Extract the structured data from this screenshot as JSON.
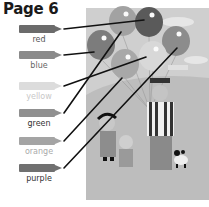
{
  "page": {
    "title": "Page 6"
  },
  "crayons": [
    {
      "label": "red",
      "body_color": "#6b6b6b",
      "label_color": "#555555",
      "y": 25
    },
    {
      "label": "blue",
      "body_color": "#8a8a8a",
      "label_color": "#666666",
      "y": 51
    },
    {
      "label": "yellow",
      "body_color": "#dcdcdc",
      "label_color": "#c8c8c8",
      "y": 82
    },
    {
      "label": "green",
      "body_color": "#909090",
      "label_color": "#333333",
      "y": 109
    },
    {
      "label": "orange",
      "body_color": "#a4a4a4",
      "label_color": "#aaaaaa",
      "y": 137
    },
    {
      "label": "purple",
      "body_color": "#707070",
      "label_color": "#333333",
      "y": 164
    }
  ],
  "balloons": [
    {
      "name": "top-left-balloon",
      "cx": 123,
      "cy": 21,
      "fill": "#a2a2a2"
    },
    {
      "name": "dark-balloon",
      "cx": 149,
      "cy": 22,
      "fill": "#5a5a5a"
    },
    {
      "name": "left-balloon",
      "cx": 101,
      "cy": 45,
      "fill": "#7c7c7c"
    },
    {
      "name": "right-balloon",
      "cx": 176,
      "cy": 41,
      "fill": "#8c8c8c"
    },
    {
      "name": "light-balloon",
      "cx": 153,
      "cy": 56,
      "fill": "#d8d8d8"
    },
    {
      "name": "lower-balloon",
      "cx": 125,
      "cy": 64,
      "fill": "#a8a8a8"
    }
  ],
  "match_lines": [
    {
      "from": "red",
      "x1": 64,
      "y1": 29,
      "x2": 144,
      "y2": 20
    },
    {
      "from": "blue",
      "x1": 64,
      "y1": 55,
      "x2": 94,
      "y2": 52
    },
    {
      "from": "yellow",
      "x1": 64,
      "y1": 86,
      "x2": 146,
      "y2": 57
    },
    {
      "from": "green",
      "x1": 64,
      "y1": 113,
      "x2": 121,
      "y2": 32
    },
    {
      "from": "orange",
      "x1": 64,
      "y1": 141,
      "x2": 122,
      "y2": 78
    },
    {
      "from": "purple",
      "x1": 64,
      "y1": 168,
      "x2": 177,
      "y2": 48
    }
  ]
}
